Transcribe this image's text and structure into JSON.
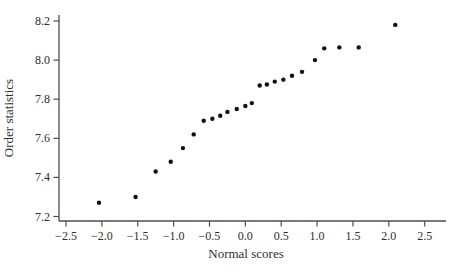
{
  "chart_data": {
    "type": "scatter",
    "title": "",
    "xlabel": "Normal scores",
    "ylabel": "Order statistics",
    "xlim": [
      -2.5,
      2.5
    ],
    "ylim": [
      7.2,
      8.2
    ],
    "grid": false,
    "legend": null,
    "marker": "filled-circle",
    "xticks": [
      -2.5,
      -2.0,
      -1.5,
      -1.0,
      -0.5,
      0.0,
      0.5,
      1.0,
      1.5,
      2.0,
      2.5
    ],
    "xtick_labels": [
      "−2.5",
      "−2.0",
      "−1.5",
      "−1.0",
      "−0.5",
      "0.0",
      "0.5",
      "1.0",
      "1.5",
      "2.0",
      "2.5"
    ],
    "yticks": [
      7.2,
      7.4,
      7.6,
      7.8,
      8.0,
      8.2
    ],
    "ytick_labels": [
      "7.2",
      "7.4",
      "7.6",
      "7.8",
      "8.0",
      "8.2"
    ],
    "points": [
      [
        -2.04,
        7.27
      ],
      [
        -1.53,
        7.3
      ],
      [
        -1.25,
        7.43
      ],
      [
        -1.04,
        7.48
      ],
      [
        -0.87,
        7.55
      ],
      [
        -0.72,
        7.62
      ],
      [
        -0.58,
        7.69
      ],
      [
        -0.46,
        7.7
      ],
      [
        -0.35,
        7.715
      ],
      [
        -0.25,
        7.735
      ],
      [
        -0.12,
        7.75
      ],
      [
        0.0,
        7.765
      ],
      [
        0.09,
        7.78
      ],
      [
        0.2,
        7.87
      ],
      [
        0.3,
        7.875
      ],
      [
        0.41,
        7.89
      ],
      [
        0.53,
        7.9
      ],
      [
        0.65,
        7.92
      ],
      [
        0.79,
        7.94
      ],
      [
        0.97,
        8.0
      ],
      [
        1.1,
        8.06
      ],
      [
        1.31,
        8.065
      ],
      [
        1.58,
        8.065
      ],
      [
        2.09,
        8.18
      ]
    ],
    "colors": {
      "point": "#111111",
      "axis": "#4d4d4d",
      "text": "#2e2e2e"
    }
  }
}
